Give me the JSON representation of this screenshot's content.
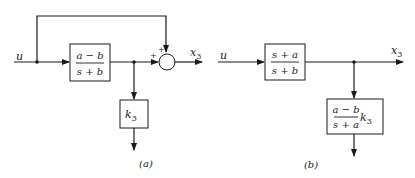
{
  "diagram_a": {
    "caption": "(a)",
    "input_label": "u",
    "output_label": "x",
    "output_subscript": "3",
    "block1": {
      "numerator": "a − b",
      "denominator": "s + b"
    },
    "block2": {
      "label": "k",
      "subscript": "3"
    },
    "summer": {
      "sign_top": "+",
      "sign_left": "+"
    }
  },
  "diagram_b": {
    "caption": "(b)",
    "input_label": "u",
    "output_label": "x",
    "output_subscript": "3",
    "block1": {
      "numerator": "s + a",
      "denominator": "s + b"
    },
    "block2": {
      "numerator": "a − b",
      "denominator": "s + a",
      "gain": "k",
      "gain_subscript": "3"
    }
  },
  "colors": {
    "line": "#1a1a1a",
    "background": "#ffffff"
  }
}
